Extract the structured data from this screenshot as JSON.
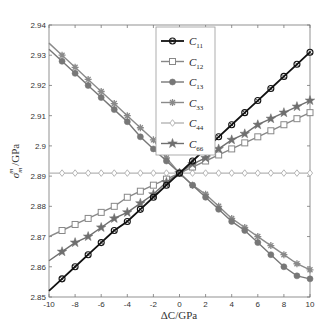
{
  "chart_data": {
    "type": "line",
    "title": "",
    "xlabel": "ΔC/GPa",
    "ylabel": "σ_m^m /GPa",
    "xlim": [
      -10,
      10
    ],
    "ylim": [
      2.85,
      2.94
    ],
    "xticks": [
      -10,
      -8,
      -6,
      -4,
      -2,
      0,
      2,
      4,
      6,
      8,
      10
    ],
    "xtick_labels": [
      "-10",
      "-8",
      "-6",
      "-4",
      "-2",
      "0",
      "2",
      "4",
      "6",
      "8",
      "10"
    ],
    "yticks": [
      2.85,
      2.86,
      2.87,
      2.88,
      2.89,
      2.9,
      2.91,
      2.92,
      2.93,
      2.94
    ],
    "ytick_labels": [
      "2.85",
      "2.86",
      "2.87",
      "2.88",
      "2.89",
      "2.9",
      "2.91",
      "2.92",
      "2.93",
      "2.94"
    ],
    "grid": false,
    "legend_position": "upper center",
    "x": [
      -10,
      -9,
      -8,
      -7,
      -6,
      -5,
      -4,
      -3,
      -2,
      -1,
      0,
      1,
      2,
      3,
      4,
      5,
      6,
      7,
      8,
      9,
      10
    ],
    "series": [
      {
        "name": "C11",
        "sub": "11",
        "color": "#111111",
        "marker": "circle-x",
        "start": 2.852,
        "end": 2.931,
        "values": [
          2.852,
          2.856,
          2.86,
          2.864,
          2.868,
          2.872,
          2.875,
          2.879,
          2.883,
          2.887,
          2.891,
          2.895,
          2.899,
          2.903,
          2.907,
          2.911,
          2.915,
          2.919,
          2.923,
          2.927,
          2.931
        ]
      },
      {
        "name": "C12",
        "sub": "12",
        "color": "#888888",
        "marker": "square",
        "start": 2.87,
        "end": 2.911,
        "values": [
          2.87,
          2.872,
          2.874,
          2.876,
          2.878,
          2.88,
          2.883,
          2.885,
          2.887,
          2.889,
          2.891,
          2.893,
          2.895,
          2.897,
          2.899,
          2.901,
          2.903,
          2.905,
          2.907,
          2.909,
          2.911
        ]
      },
      {
        "name": "C13",
        "sub": "13",
        "color": "#777777",
        "marker": "dot",
        "start": 2.932,
        "end": 2.856,
        "values": [
          2.932,
          2.928,
          2.924,
          2.92,
          2.916,
          2.912,
          2.908,
          2.903,
          2.899,
          2.895,
          2.891,
          2.887,
          2.883,
          2.879,
          2.875,
          2.872,
          2.868,
          2.864,
          2.86,
          2.857,
          2.856
        ]
      },
      {
        "name": "C33",
        "sub": "33",
        "color": "#8a8a8a",
        "marker": "asterisk",
        "start": 2.934,
        "end": 2.859,
        "values": [
          2.934,
          2.93,
          2.926,
          2.922,
          2.918,
          2.914,
          2.91,
          2.906,
          2.902,
          2.896,
          2.891,
          2.887,
          2.884,
          2.88,
          2.876,
          2.873,
          2.87,
          2.867,
          2.864,
          2.861,
          2.859
        ]
      },
      {
        "name": "C44",
        "sub": "44",
        "color": "#b5b5b5",
        "marker": "diamond",
        "start": 2.891,
        "end": 2.891,
        "values": [
          2.891,
          2.891,
          2.891,
          2.891,
          2.891,
          2.891,
          2.891,
          2.891,
          2.891,
          2.891,
          2.891,
          2.891,
          2.891,
          2.891,
          2.891,
          2.891,
          2.891,
          2.891,
          2.891,
          2.891,
          2.891
        ]
      },
      {
        "name": "C66",
        "sub": "66",
        "color": "#6f6f6f",
        "marker": "star",
        "start": 2.862,
        "end": 2.915,
        "values": [
          2.862,
          2.865,
          2.868,
          2.87,
          2.873,
          2.876,
          2.878,
          2.881,
          2.884,
          2.888,
          2.891,
          2.894,
          2.896,
          2.899,
          2.902,
          2.904,
          2.907,
          2.909,
          2.911,
          2.913,
          2.915
        ]
      }
    ]
  }
}
